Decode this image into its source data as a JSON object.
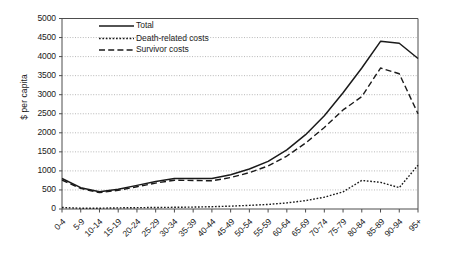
{
  "chart_data": {
    "type": "line",
    "title": "",
    "xlabel": "",
    "ylabel": "$ per capita",
    "ylim": [
      0,
      5000
    ],
    "ytick_step": 500,
    "grid": true,
    "legend_position": "top-left-inside",
    "categories": [
      "0-4",
      "5-9",
      "10-14",
      "15-19",
      "20-24",
      "25-29",
      "30-34",
      "35-39",
      "40-44",
      "45-49",
      "50-54",
      "55-59",
      "60-64",
      "65-69",
      "70-74",
      "75-79",
      "80-84",
      "85-89",
      "90-94",
      "95+"
    ],
    "yticks": [
      "0",
      "500",
      "1000",
      "1500",
      "2000",
      "2500",
      "3000",
      "3500",
      "4000",
      "4500",
      "5000"
    ],
    "series": [
      {
        "name": "Total",
        "style": "solid",
        "color": "#1a1a1a",
        "values": [
          800,
          560,
          450,
          520,
          620,
          720,
          800,
          800,
          800,
          900,
          1050,
          1250,
          1550,
          1950,
          2450,
          3050,
          3700,
          4400,
          4350,
          3950
        ]
      },
      {
        "name": "Death-related costs",
        "style": "dotted",
        "color": "#1a1a1a",
        "values": [
          40,
          20,
          20,
          30,
          35,
          40,
          45,
          50,
          60,
          75,
          95,
          120,
          160,
          220,
          310,
          450,
          750,
          700,
          560,
          1150
        ]
      },
      {
        "name": "Survivor costs",
        "style": "dashed",
        "color": "#1a1a1a",
        "values": [
          760,
          540,
          430,
          490,
          585,
          680,
          755,
          750,
          740,
          825,
          955,
          1130,
          1390,
          1730,
          2140,
          2600,
          2950,
          3700,
          3550,
          2500
        ]
      }
    ]
  },
  "legend": {
    "items": [
      {
        "label": "Total"
      },
      {
        "label": "Death-related costs"
      },
      {
        "label": "Survivor costs"
      }
    ]
  },
  "colors": {
    "ink": "#1a1a1a",
    "grid": "#9a9a9a",
    "axis": "#4d4d4d",
    "background": "#ffffff"
  }
}
